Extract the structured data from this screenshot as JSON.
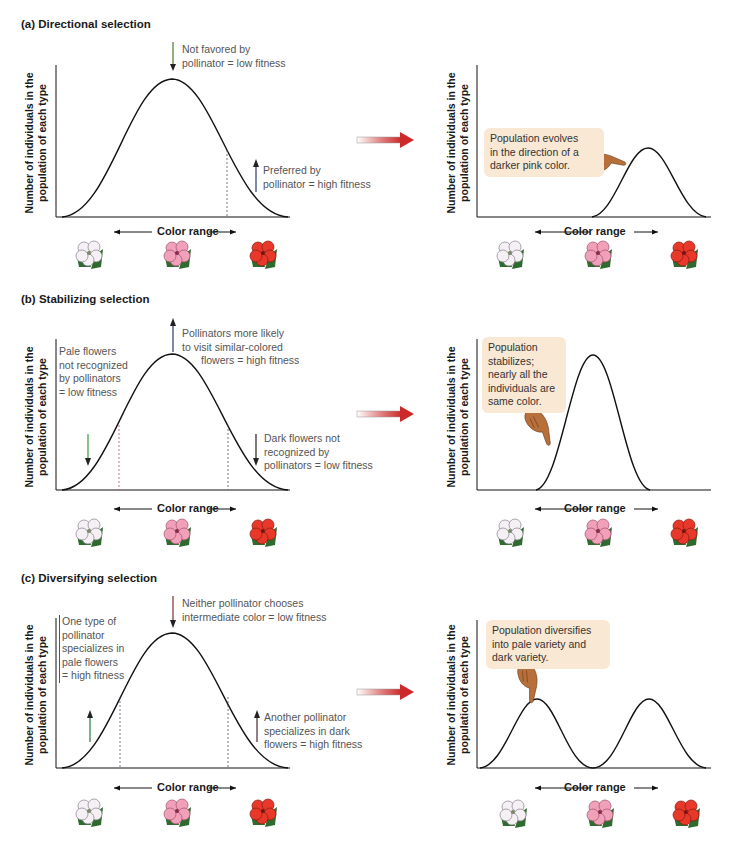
{
  "panels": [
    {
      "id": "a",
      "title": "(a) Directional selection",
      "before": {
        "y_axis_label_line1": "Number of individuals in the",
        "y_axis_label_line2": "population of each type",
        "x_axis_label": "Color range",
        "annotations": [
          {
            "text_line1": "Not favored by",
            "text_line2": "pollinator = low fitness",
            "arrow": "down",
            "arrow_color": "#4a7a2a"
          },
          {
            "text_line1": "Preferred by",
            "text_line2": "pollinator = high fitness",
            "arrow": "up",
            "arrow_color": "#2a3a6a"
          }
        ]
      },
      "after": {
        "y_axis_label_line1": "Number of individuals in the",
        "y_axis_label_line2": "population of each type",
        "x_axis_label": "Color range",
        "callout_line1": "Population evolves",
        "callout_line2": "in the direction of a",
        "callout_line3": "darker pink color."
      }
    },
    {
      "id": "b",
      "title": "(b) Stabilizing selection",
      "before": {
        "y_axis_label_line1": "Number of individuals in the",
        "y_axis_label_line2": "population of each type",
        "x_axis_label": "Color range",
        "annotations": [
          {
            "text_line1": "Pollinators more likely",
            "text_line2": "to visit similar-colored",
            "text_line3": "flowers = high fitness",
            "arrow": "up",
            "arrow_color": "#2a3a6a"
          },
          {
            "text_line1": "Pale flowers",
            "text_line2": "not recognized",
            "text_line3": "by pollinators",
            "text_line4": "= low fitness",
            "arrow": "down",
            "arrow_color": "#3a9a3a"
          },
          {
            "text_line1": "Dark flowers not",
            "text_line2": "recognized by",
            "text_line3": "pollinators = low fitness",
            "arrow": "down",
            "arrow_color": "#222222"
          }
        ]
      },
      "after": {
        "y_axis_label_line1": "Number of individuals in the",
        "y_axis_label_line2": "population of each type",
        "x_axis_label": "Color range",
        "callout_line1": "Population",
        "callout_line2": "stabilizes;",
        "callout_line3": "nearly all the",
        "callout_line4": "individuals are",
        "callout_line5": "same color."
      }
    },
    {
      "id": "c",
      "title": "(c) Diversifying selection",
      "before": {
        "y_axis_label_line1": "Number of individuals in the",
        "y_axis_label_line2": "population of each type",
        "x_axis_label": "Color range",
        "annotations": [
          {
            "text_line1": "Neither pollinator chooses",
            "text_line2": "intermediate  color = low fitness",
            "arrow": "down",
            "arrow_color": "#8a2a2a"
          },
          {
            "text_line1": "One type of",
            "text_line2": "pollinator",
            "text_line3": "specializes in",
            "text_line4": "pale flowers",
            "text_line5": "= high fitness",
            "arrow": "up",
            "arrow_color": "#2a7a4a"
          },
          {
            "text_line1": "Another pollinator",
            "text_line2": "specializes in dark",
            "text_line3": "flowers = high fitness",
            "arrow": "up",
            "arrow_color": "#4a2a2a"
          }
        ]
      },
      "after": {
        "y_axis_label_line1": "Number of individuals in the",
        "y_axis_label_line2": "population of each type",
        "x_axis_label": "Color range",
        "callout_line1": "Population diversifies",
        "callout_line2": "into pale variety and",
        "callout_line3": "dark variety."
      }
    }
  ],
  "flowers": [
    {
      "name": "pale",
      "color": "#f2eef2",
      "edge": "#8a8090"
    },
    {
      "name": "pink",
      "color": "#f0a0b8",
      "edge": "#a05070"
    },
    {
      "name": "dark",
      "color": "#e8382a",
      "edge": "#8a1a10"
    }
  ],
  "colors": {
    "transition_arrow": "#d03a3a",
    "callout_bg": "#f8e8d4",
    "leaf": "#2f6a2f",
    "curve": "#111111"
  }
}
